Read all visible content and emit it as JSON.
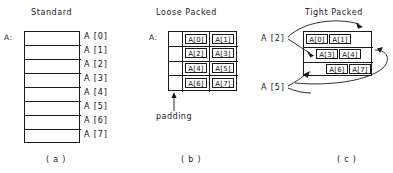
{
  "figure": {
    "panels": [
      {
        "id": "standard",
        "title": "Standard",
        "caption": "( a )",
        "base_label": "A:",
        "layout": "one-element-per-row",
        "rows": 8,
        "cells": [
          "A [0]",
          "A [1]",
          "A [2]",
          "A [3]",
          "A [4]",
          "A [5]",
          "A [6]",
          "A [7]"
        ]
      },
      {
        "id": "loose-packed",
        "title": "Loose Packed",
        "caption": "( b )",
        "base_label": "A:",
        "layout": "grid-3-col-4-row-first-col-padding",
        "columns": 3,
        "rows": 4,
        "padding_label": "padding",
        "grid": [
          [
            "",
            "A[0]",
            "A[1]"
          ],
          [
            "",
            "A[2]",
            "A[3]"
          ],
          [
            "",
            "A[4]",
            "A[5]"
          ],
          [
            "",
            "A[6]",
            "A[7]"
          ]
        ]
      },
      {
        "id": "tight-packed",
        "title": "Tight Packed",
        "caption": "( c )",
        "layout": "grid-3-row-staggered-no-padding",
        "rows": 3,
        "grid": [
          [
            "A[0]",
            "A[1]",
            ""
          ],
          [
            "",
            "A[3]",
            "A[4]"
          ],
          [
            "",
            "A[6]",
            "A[7]"
          ]
        ],
        "pointer_labels": [
          "A [2]",
          "A [5]"
        ],
        "pointer_notes": [
          "A [2] spans the end of row 1 and the start of row 2",
          "A [5] spans the end of row 2 and the start of row 3"
        ]
      }
    ]
  },
  "style": {
    "stroke": "#1a1a1a",
    "background": "#ffffff"
  }
}
